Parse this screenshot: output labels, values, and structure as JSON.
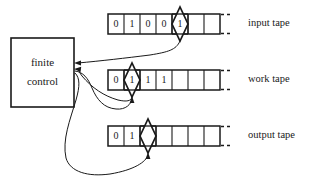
{
  "figure": {
    "background_color": "#ffffff",
    "line_color": "#1a1a1a"
  },
  "control": {
    "label_line1": "finite",
    "label_line2": "control",
    "shape": "rectangle"
  },
  "tapes": [
    {
      "id": "input-tape",
      "label": "input tape",
      "cells": [
        "0",
        "1",
        "0",
        "0",
        "1",
        "",
        ""
      ],
      "head_cell_index": 4,
      "head_icon": "diamond-head-icon",
      "continues": true,
      "continuation_mark": "dashes"
    },
    {
      "id": "work-tape",
      "label": "work tape",
      "cells": [
        "0",
        "1",
        "1",
        "1",
        "",
        "",
        ""
      ],
      "head_cell_index": 1,
      "head_icon": "diamond-head-icon",
      "continues": true,
      "continuation_mark": "dashes"
    },
    {
      "id": "output-tape",
      "label": "output tape",
      "cells": [
        "0",
        "1",
        "",
        "",
        "",
        "",
        ""
      ],
      "head_cell_index": 2,
      "head_icon": "diamond-head-icon",
      "continues": true,
      "continuation_mark": "dashes"
    }
  ],
  "connections": [
    {
      "id": "input-read-wire",
      "from": "input-tape-head",
      "to": "finite-control",
      "direction": "read",
      "arrowhead_at": "finite-control"
    },
    {
      "id": "work-read-wire",
      "from": "work-tape-head",
      "to": "finite-control",
      "direction": "read",
      "arrowhead_at": "finite-control"
    },
    {
      "id": "work-write-wire",
      "from": "finite-control",
      "to": "work-tape-head",
      "direction": "write",
      "arrowhead_at": "work-tape-head"
    },
    {
      "id": "output-write-wire",
      "from": "finite-control",
      "to": "output-tape-head",
      "direction": "write",
      "arrowhead_at": "output-tape-head"
    }
  ]
}
